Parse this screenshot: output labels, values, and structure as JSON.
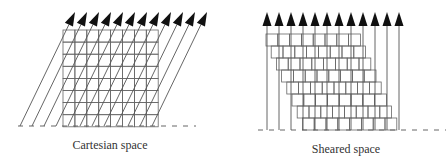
{
  "panels": [
    {
      "id": "cartesian",
      "caption": "Cartesian space",
      "caption_pos": [
        110,
        138
      ],
      "grid": {
        "x0": 63,
        "y0": 30,
        "cols": 8,
        "rows": 8,
        "cell_w": 11.9,
        "cell_h": 12.1,
        "row_shift": 0
      },
      "arrows": {
        "count": 12,
        "start_x": 20,
        "spacing": 12,
        "base_y": 126,
        "dx": 55,
        "tip_y": 12
      },
      "baseline": {
        "y": 126,
        "x_start": 18,
        "x_end": 196
      }
    },
    {
      "id": "sheared",
      "caption": "Sheared space",
      "caption_pos": [
        346,
        142
      ],
      "grid": {
        "x0": 266,
        "y0": 34,
        "cols": 8,
        "rows": 8,
        "cell_w": 11.8,
        "cell_h": 12,
        "row_shift": 5.2
      },
      "arrows": {
        "count": 12,
        "start_x": 267,
        "spacing": 12,
        "base_y": 130,
        "dx": 0,
        "tip_y": 12
      },
      "baseline": {
        "y": 130,
        "x_start": 258,
        "x_end": 446
      }
    }
  ],
  "colors": {
    "line": "#555555",
    "arrowhead": "#111111",
    "grid": "#666666",
    "text": "#333333"
  }
}
